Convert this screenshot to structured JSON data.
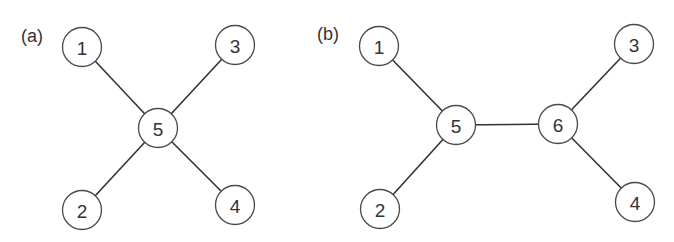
{
  "figure": {
    "panels": [
      {
        "id": "a",
        "label": "(a)",
        "label_pos": {
          "x": 21,
          "y": 42
        },
        "nodes": [
          {
            "id": "1",
            "label": "1",
            "x": 82,
            "y": 47
          },
          {
            "id": "3",
            "label": "3",
            "x": 235,
            "y": 45
          },
          {
            "id": "5",
            "label": "5",
            "x": 158,
            "y": 128
          },
          {
            "id": "2",
            "label": "2",
            "x": 82,
            "y": 210
          },
          {
            "id": "4",
            "label": "4",
            "x": 235,
            "y": 205
          }
        ],
        "edges": [
          [
            "1",
            "5"
          ],
          [
            "3",
            "5"
          ],
          [
            "2",
            "5"
          ],
          [
            "4",
            "5"
          ]
        ]
      },
      {
        "id": "b",
        "label": "(b)",
        "label_pos": {
          "x": 317,
          "y": 40
        },
        "nodes": [
          {
            "id": "1",
            "label": "1",
            "x": 379,
            "y": 46
          },
          {
            "id": "2",
            "label": "2",
            "x": 380,
            "y": 209
          },
          {
            "id": "5",
            "label": "5",
            "x": 456,
            "y": 125
          },
          {
            "id": "6",
            "label": "6",
            "x": 558,
            "y": 124
          },
          {
            "id": "3",
            "label": "3",
            "x": 634,
            "y": 44
          },
          {
            "id": "4",
            "label": "4",
            "x": 635,
            "y": 202
          }
        ],
        "edges": [
          [
            "1",
            "5"
          ],
          [
            "2",
            "5"
          ],
          [
            "5",
            "6"
          ],
          [
            "3",
            "6"
          ],
          [
            "4",
            "6"
          ]
        ]
      }
    ],
    "node_radius": 19.5,
    "colors": {
      "edge": "#333333",
      "node_stroke": "#4a4a4a",
      "node_fill": "#ffffff",
      "text": "#333333",
      "background": "#ffffff"
    }
  }
}
